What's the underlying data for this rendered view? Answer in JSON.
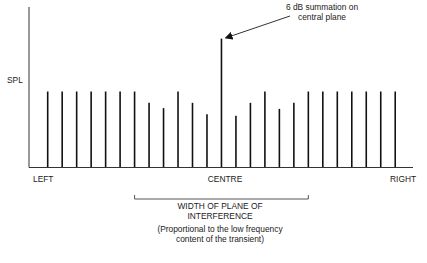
{
  "chart_data": {
    "type": "bar",
    "title": "",
    "ylabel": "SPL",
    "xlabel": "",
    "x_tick_labels": [
      "LEFT",
      "CENTRE",
      "RIGHT"
    ],
    "categories": [
      "1",
      "2",
      "3",
      "4",
      "5",
      "6",
      "7",
      "8",
      "9",
      "10",
      "11",
      "12",
      "13",
      "14",
      "15",
      "16",
      "17",
      "18",
      "19",
      "20",
      "21",
      "22",
      "23",
      "24",
      "25"
    ],
    "values": [
      10,
      10,
      10,
      10,
      10,
      10,
      10,
      8.5,
      7.8,
      10,
      8.5,
      7.0,
      17.0,
      6.8,
      8.5,
      10,
      7.7,
      8.5,
      10,
      10,
      10,
      10,
      10,
      10,
      10
    ],
    "center_index": 12,
    "ylim": [
      0,
      21
    ],
    "units_note": "relative SPL, baseline = 0, typical bar = 10",
    "grid": false,
    "annotation": {
      "text_line1": "6 dB summation on",
      "text_line2": "central plane",
      "points_to_index": 12
    },
    "bracket": {
      "from_index": 6,
      "to_index": 18,
      "label_line1": "WIDTH OF PLANE OF",
      "label_line2": "INTERFERENCE",
      "note_line1": "(Proportional to the low frequency",
      "note_line2": "content of the transient)"
    }
  },
  "labels": {
    "y_axis": "SPL",
    "left": "LEFT",
    "centre": "CENTRE",
    "right": "RIGHT",
    "annotation_line1": "6 dB summation on",
    "annotation_line2": "central plane",
    "width_line1": "WIDTH OF PLANE OF",
    "width_line2": "INTERFERENCE",
    "note_line1": "(Proportional to the low frequency",
    "note_line2": "content of the transient)"
  }
}
